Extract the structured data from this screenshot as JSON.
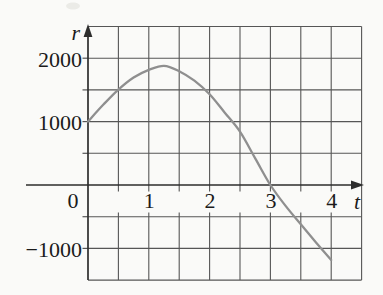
{
  "chart_data": {
    "type": "line",
    "title": "",
    "xlabel": "t",
    "ylabel": "r",
    "xlim": [
      0,
      4.5
    ],
    "ylim": [
      -1500,
      2500
    ],
    "grid": {
      "visible": true,
      "x_step": 0.5,
      "y_step": 500
    },
    "x_tick_labels": [
      {
        "value": 1,
        "label": "1"
      },
      {
        "value": 2,
        "label": "2"
      },
      {
        "value": 3,
        "label": "3"
      },
      {
        "value": 4,
        "label": "4"
      }
    ],
    "y_tick_labels": [
      {
        "value": 2000,
        "label": "2000"
      },
      {
        "value": 1000,
        "label": "1000"
      },
      {
        "value": -1000,
        "label": "−1000"
      }
    ],
    "origin_label": "0",
    "series": [
      {
        "name": "r-curve",
        "x": [
          0,
          0.25,
          0.5,
          0.75,
          1,
          1.25,
          1.5,
          1.75,
          2,
          2.25,
          2.5,
          2.75,
          3,
          3.25,
          3.5,
          3.75,
          4
        ],
        "y": [
          1000,
          1265,
          1505,
          1695,
          1815,
          1880,
          1795,
          1645,
          1430,
          1140,
          840,
          420,
          0,
          -330,
          -620,
          -905,
          -1185
        ]
      }
    ],
    "key_points": {
      "start": [
        0,
        1000
      ],
      "peak": [
        1.25,
        1880
      ],
      "zero_crossing": [
        3,
        0
      ],
      "end": [
        4,
        -1185
      ]
    }
  },
  "colors": {
    "background": "#fafaf8",
    "grid": "#565656",
    "axis": "#2d2d2d",
    "curve": "#8f8f8f",
    "text": "#1b1b1b",
    "smudge": "#d9d9d3"
  }
}
